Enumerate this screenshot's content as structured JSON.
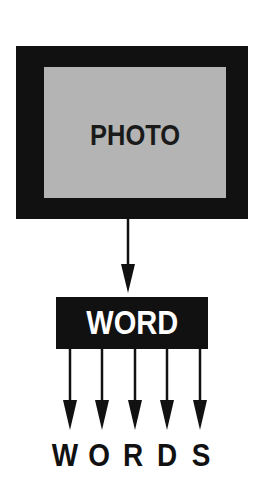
{
  "diagram": {
    "photo_box": {
      "label": "PHOTO",
      "frame_color": "#111111",
      "fill_color": "#b4b4b4"
    },
    "word_box": {
      "label": "WORD",
      "fill_color": "#111111",
      "text_color": "#ffffff"
    },
    "output": {
      "label": "WORDS",
      "letters": [
        "W",
        "O",
        "R",
        "D",
        "S"
      ]
    },
    "arrows": {
      "photo_to_word": 1,
      "word_to_words": 5
    }
  }
}
